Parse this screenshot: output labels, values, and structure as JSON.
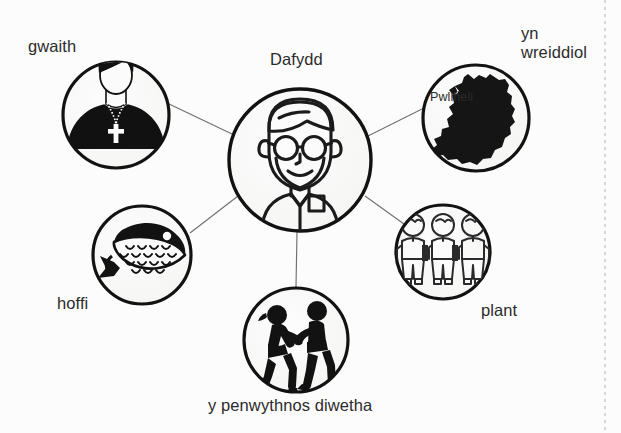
{
  "diagram": {
    "type": "mind-map",
    "title_node": "Dafydd",
    "background_color": "#fcfcfc",
    "stroke_color": "#1a1a1a",
    "connector_color": "#6d6d6d",
    "label_color": "#2b2b2b",
    "center": {
      "label": "Dafydd",
      "icon": "man-with-glasses-icon",
      "cx": 300,
      "cy": 160,
      "r": 72
    },
    "nodes": [
      {
        "id": "gwaith",
        "label": "gwaith",
        "icon": "priest-icon",
        "cx": 116,
        "cy": 115,
        "r": 54,
        "label_x": 28,
        "label_y": 37,
        "label_align": "left"
      },
      {
        "id": "yn-wreiddiol",
        "label": "yn\nwreiddiol",
        "label_lines": [
          "yn",
          "wreiddiol"
        ],
        "icon": "wales-map-icon",
        "icon_caption": "Pwllheli",
        "cx": 476,
        "cy": 118,
        "r": 54,
        "label_x": 521,
        "label_y": 24,
        "label_align": "left"
      },
      {
        "id": "hoffi",
        "label": "hoffi",
        "icon": "fish-icon",
        "cx": 142,
        "cy": 255,
        "r": 50,
        "label_x": 57,
        "label_y": 294,
        "label_align": "left"
      },
      {
        "id": "plant",
        "label": "plant",
        "icon": "three-children-icon",
        "cx": 443,
        "cy": 252,
        "r": 48,
        "label_x": 481,
        "label_y": 301,
        "label_align": "left"
      },
      {
        "id": "y-penwythnos-diwetha",
        "label": "y penwythnos diwetha",
        "icon": "dancing-couple-icon",
        "cx": 296,
        "cy": 340,
        "r": 53,
        "label_x": 208,
        "label_y": 396,
        "label_align": "left"
      }
    ],
    "connectors": [
      {
        "from": "center",
        "to": "gwaith"
      },
      {
        "from": "center",
        "to": "yn-wreiddiol"
      },
      {
        "from": "center",
        "to": "hoffi"
      },
      {
        "from": "center",
        "to": "plant"
      },
      {
        "from": "center",
        "to": "y-penwythnos-diwetha"
      }
    ]
  }
}
